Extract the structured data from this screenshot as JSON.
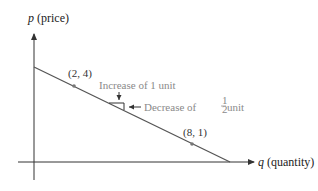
{
  "diagram": {
    "type": "linear demand curve",
    "y_axis": {
      "var": "p",
      "label": " (price)"
    },
    "x_axis": {
      "var": "q",
      "label": " (quantity)"
    },
    "line": {
      "p_intercept": 5,
      "q_intercept": 10,
      "slope": -0.5
    },
    "points": [
      {
        "label": "(2, 4)",
        "q": 2,
        "p": 4
      },
      {
        "label": "(8, 1)",
        "q": 8,
        "p": 1
      }
    ],
    "annotations": {
      "increase": "Increase of 1 unit",
      "decrease_prefix": "Decrease of ",
      "decrease_fraction_num": "1",
      "decrease_fraction_den": "2",
      "decrease_suffix": " unit"
    },
    "colors": {
      "axis": "#333333",
      "line": "#555555",
      "point": "#777777",
      "annotation": "#8a8a8a"
    }
  }
}
